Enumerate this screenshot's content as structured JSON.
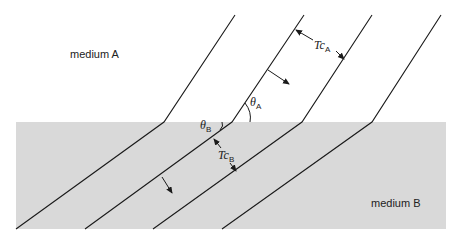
{
  "diagram": {
    "colors": {
      "background": "#ffffff",
      "medium_b_fill": "#d9d9d9",
      "line": "#1a1a1a",
      "text": "#222222"
    },
    "media": [
      {
        "id": "A",
        "label": "medium A"
      },
      {
        "id": "B",
        "label": "medium B"
      }
    ],
    "labels": {
      "theta_a": {
        "symbol": "θ",
        "subscript": "A"
      },
      "theta_b": {
        "symbol": "θ",
        "subscript": "B"
      },
      "tc_a": {
        "symbol": "Tc",
        "subscript": "A"
      },
      "tc_b": {
        "symbol": "Tc",
        "subscript": "B"
      }
    },
    "wavefronts": [
      {
        "top": [
          235,
          15
        ],
        "kink": [
          164,
          122
        ],
        "bottom": [
          16,
          229
        ]
      },
      {
        "top": [
          304,
          15
        ],
        "kink": [
          232,
          122
        ],
        "bottom": [
          85,
          229
        ]
      },
      {
        "top": [
          372,
          15
        ],
        "kink": [
          302,
          122
        ],
        "bottom": [
          153,
          229
        ]
      },
      {
        "top": [
          441,
          15
        ],
        "kink": [
          372,
          122
        ],
        "bottom": [
          222,
          229
        ]
      }
    ],
    "propagation_arrows": [
      {
        "medium": "A",
        "direction": "down-right"
      },
      {
        "medium": "B",
        "direction": "down-right"
      }
    ]
  }
}
